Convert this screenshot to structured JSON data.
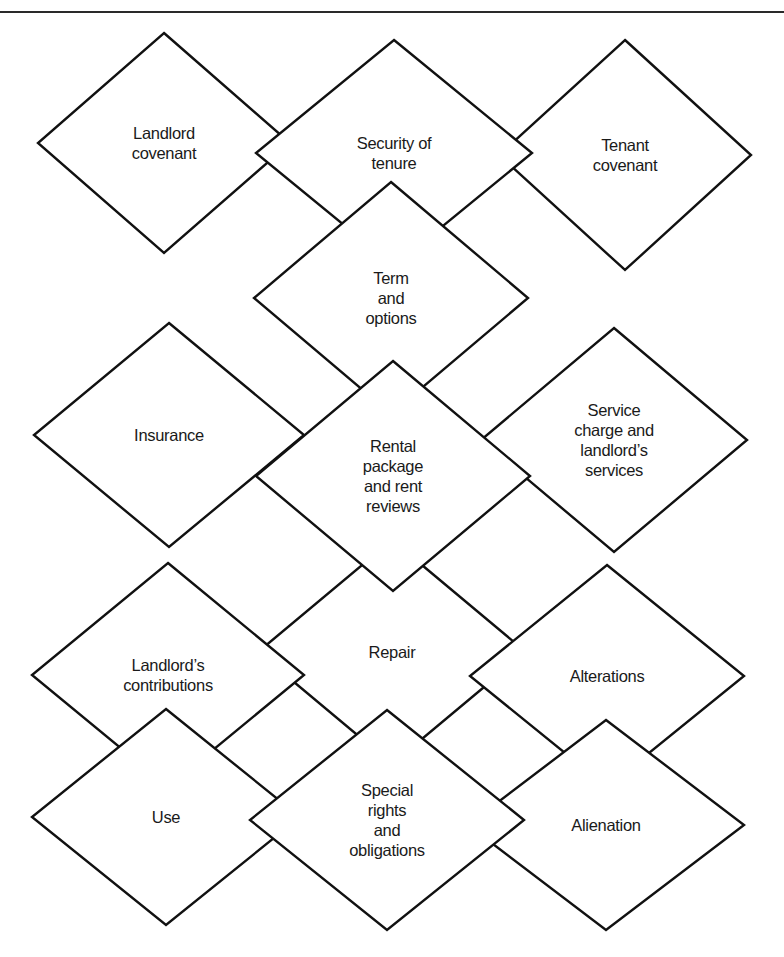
{
  "figure": {
    "rule_color": "#2a2a2a",
    "stroke_color": "#111111",
    "fill_color": "#ffffff",
    "text_color": "#1a1a1a",
    "diamonds": [
      {
        "id": "repair",
        "lines": [
          "Repair"
        ],
        "cx": 392,
        "cy": 652,
        "hw": 134,
        "hh": 112
      },
      {
        "id": "landlord-covenant",
        "lines": [
          "Landlord",
          "covenant"
        ],
        "cx": 164,
        "cy": 143,
        "hw": 126,
        "hh": 110
      },
      {
        "id": "tenant-covenant",
        "lines": [
          "Tenant",
          "covenant"
        ],
        "cx": 625,
        "cy": 155,
        "hw": 126,
        "hh": 115
      },
      {
        "id": "security-of-tenure",
        "lines": [
          "Security of",
          "tenure"
        ],
        "cx": 394,
        "cy": 153,
        "hw": 138,
        "hh": 113
      },
      {
        "id": "insurance",
        "lines": [
          "Insurance"
        ],
        "cx": 169,
        "cy": 435,
        "hw": 135,
        "hh": 112
      },
      {
        "id": "service-charge",
        "lines": [
          "Service",
          "charge and",
          "landlord’s",
          "services"
        ],
        "cx": 614,
        "cy": 440,
        "hw": 133,
        "hh": 112
      },
      {
        "id": "term-and-options",
        "lines": [
          "Term",
          "and",
          "options"
        ],
        "cx": 391,
        "cy": 298,
        "hw": 137,
        "hh": 116
      },
      {
        "id": "rental-package",
        "lines": [
          "Rental",
          "package",
          "and rent",
          "reviews"
        ],
        "cx": 393,
        "cy": 476,
        "hw": 137,
        "hh": 115
      },
      {
        "id": "landlords-contributions",
        "lines": [
          "Landlord’s",
          "contributions"
        ],
        "cx": 168,
        "cy": 675,
        "hw": 136,
        "hh": 112
      },
      {
        "id": "alterations",
        "lines": [
          "Alterations"
        ],
        "cx": 607,
        "cy": 676,
        "hw": 137,
        "hh": 111
      },
      {
        "id": "use",
        "lines": [
          "Use"
        ],
        "cx": 166,
        "cy": 817,
        "hw": 134,
        "hh": 108
      },
      {
        "id": "alienation",
        "lines": [
          "Alienation"
        ],
        "cx": 606,
        "cy": 825,
        "hw": 138,
        "hh": 105
      },
      {
        "id": "special-rights",
        "lines": [
          "Special",
          "rights",
          "and",
          "obligations"
        ],
        "cx": 387,
        "cy": 820,
        "hw": 137,
        "hh": 110
      }
    ]
  }
}
